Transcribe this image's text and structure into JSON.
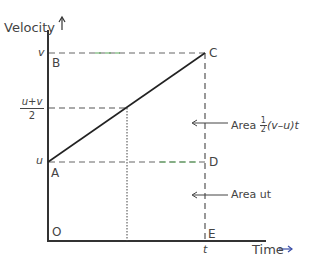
{
  "diagram": {
    "axes": {
      "y_label": "Velocity",
      "x_label": "Time"
    },
    "points": {
      "O": "O",
      "A": "A",
      "B": "B",
      "C": "C",
      "D": "D",
      "E": "E"
    },
    "y_ticks": {
      "v": "v",
      "u": "u",
      "mid_num": "u+v",
      "mid_den": "2"
    },
    "x_ticks": {
      "t": "t"
    },
    "annotations": {
      "area_triangle_prefix": "Area ",
      "area_triangle_frac_num": "1",
      "area_triangle_frac_den": "2",
      "area_triangle_suffix": "(v–u)t",
      "area_rect": "Area ut"
    },
    "colors": {
      "axis": "#333333",
      "line": "#222222",
      "dash": "#555555",
      "green_dash": "#5aa85a"
    }
  }
}
